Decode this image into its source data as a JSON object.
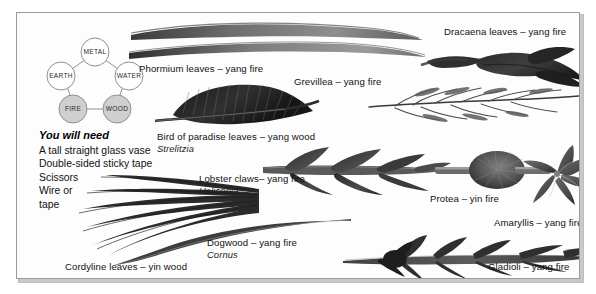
{
  "page": {
    "background": "#ffffff",
    "plate_border_color": "#9a9a9a",
    "ink_color": "#1a1a1a"
  },
  "five_elements": {
    "title": "five element cycle",
    "nodes": [
      {
        "label": "METAL",
        "position": "top",
        "fill": "#ffffff",
        "highlighted": false
      },
      {
        "label": "EARTH",
        "position": "left",
        "fill": "#ffffff",
        "highlighted": false
      },
      {
        "label": "WATER",
        "position": "right",
        "fill": "#ffffff",
        "highlighted": false
      },
      {
        "label": "FIRE",
        "position": "bottom-left",
        "fill": "#cfcfcf",
        "highlighted": true
      },
      {
        "label": "WOOD",
        "position": "bottom-right",
        "fill": "#cfcfcf",
        "highlighted": true
      }
    ],
    "stroke": "#8f8f8f"
  },
  "you_will_need": {
    "heading": "You will need",
    "items": [
      "A tall straight glass vase",
      "Double-sided sticky tape",
      "Scissors",
      "Wire or",
      "tape"
    ]
  },
  "specimens": [
    {
      "id": "phormium",
      "label": "Phormium leaves – yang fire",
      "latin": "",
      "common_name": "Phormium leaves",
      "energy": "yang fire"
    },
    {
      "id": "dracaena",
      "label": "Dracaena leaves – yang fire",
      "latin": "",
      "common_name": "Dracaena leaves",
      "energy": "yang fire"
    },
    {
      "id": "grevillea",
      "label": "Grevillea – yang fire",
      "latin": "",
      "common_name": "Grevillea",
      "energy": "yang fire"
    },
    {
      "id": "bird-of-paradise",
      "label": "Bird of paradise leaves – yang wood",
      "latin": "Strelitzia",
      "common_name": "Bird of paradise leaves",
      "energy": "yang wood"
    },
    {
      "id": "lobster-claws",
      "label": "Lobster claws– yang fire",
      "latin": "Heliconia",
      "common_name": "Lobster claws",
      "energy": "yang fire"
    },
    {
      "id": "protea",
      "label": "Protea – yin fire",
      "latin": "",
      "common_name": "Protea",
      "energy": "yin fire"
    },
    {
      "id": "amaryllis",
      "label": "Amaryllis – yang fire",
      "latin": "",
      "common_name": "Amaryllis",
      "energy": "yang fire"
    },
    {
      "id": "cordyline",
      "label": "Cordyline leaves – yin wood",
      "latin": "",
      "common_name": "Cordyline leaves",
      "energy": "yin wood"
    },
    {
      "id": "dogwood",
      "label": "Dogwood – yang fire",
      "latin": "Cornus",
      "common_name": "Dogwood",
      "energy": "yang fire"
    },
    {
      "id": "gladioli",
      "label": "Gladioli – yang fire",
      "latin": "",
      "common_name": "Gladioli",
      "energy": "yang fire"
    }
  ]
}
